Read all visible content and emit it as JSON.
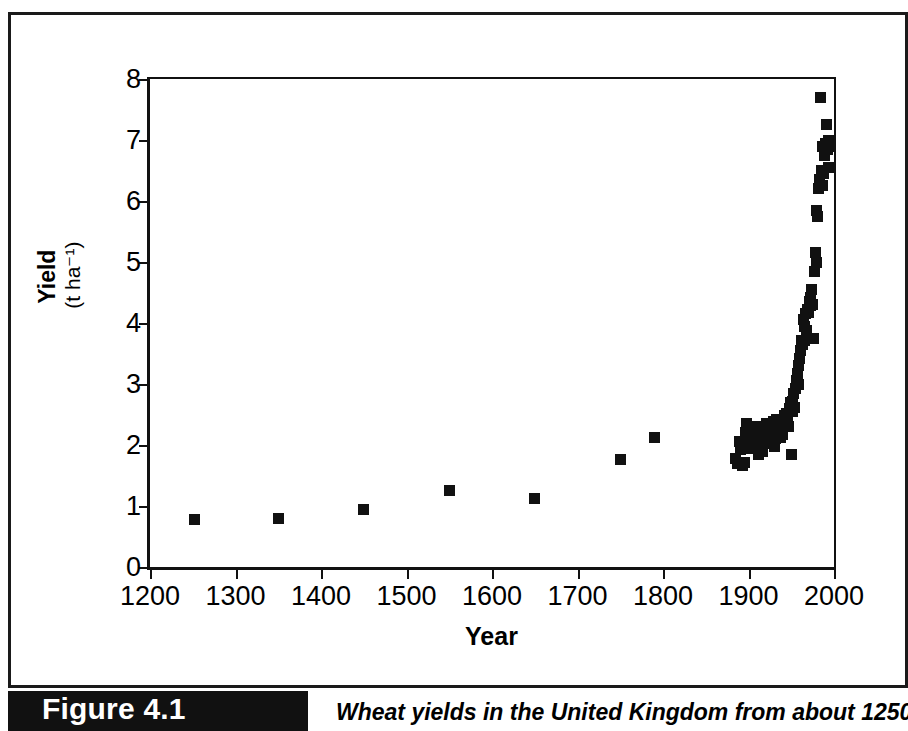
{
  "figure": {
    "tag_label": "Figure 4.1",
    "caption": "Wheat yields in the United Kingdom from about 1250 to"
  },
  "chart_data": {
    "type": "scatter",
    "title": "",
    "xlabel": "Year",
    "ylabel": "Yield",
    "ylabel_unit": "(t ha⁻¹)",
    "xlim": [
      1200,
      2000
    ],
    "ylim": [
      0,
      8
    ],
    "xticks": [
      1200,
      1300,
      1400,
      1500,
      1600,
      1700,
      1800,
      1900,
      2000
    ],
    "yticks": [
      0,
      1,
      2,
      3,
      4,
      5,
      6,
      7,
      8
    ],
    "grid": false,
    "legend": "none",
    "marker": "filled-square",
    "marker_color": "#111111",
    "points": [
      [
        1252,
        0.78
      ],
      [
        1350,
        0.79
      ],
      [
        1450,
        0.94
      ],
      [
        1550,
        1.26
      ],
      [
        1650,
        1.12
      ],
      [
        1750,
        1.76
      ],
      [
        1790,
        2.12
      ],
      [
        1885,
        1.78
      ],
      [
        1887,
        1.7
      ],
      [
        1889,
        2.05
      ],
      [
        1891,
        1.93
      ],
      [
        1893,
        1.66
      ],
      [
        1895,
        1.72
      ],
      [
        1896,
        2.2
      ],
      [
        1897,
        2.1
      ],
      [
        1898,
        2.35
      ],
      [
        1899,
        2.22
      ],
      [
        1900,
        2.12
      ],
      [
        1901,
        2.02
      ],
      [
        1902,
        2.3
      ],
      [
        1903,
        1.95
      ],
      [
        1904,
        2.18
      ],
      [
        1905,
        2.26
      ],
      [
        1906,
        2.3
      ],
      [
        1907,
        2.05
      ],
      [
        1908,
        2.18
      ],
      [
        1909,
        2.28
      ],
      [
        1910,
        2.1
      ],
      [
        1911,
        2.22
      ],
      [
        1912,
        1.85
      ],
      [
        1913,
        2.2
      ],
      [
        1914,
        2.28
      ],
      [
        1915,
        2.12
      ],
      [
        1916,
        1.9
      ],
      [
        1917,
        2.02
      ],
      [
        1918,
        2.3
      ],
      [
        1919,
        2.05
      ],
      [
        1920,
        2.18
      ],
      [
        1921,
        2.35
      ],
      [
        1922,
        2.12
      ],
      [
        1923,
        2.26
      ],
      [
        1924,
        2.2
      ],
      [
        1925,
        2.32
      ],
      [
        1926,
        2.15
      ],
      [
        1927,
        2.05
      ],
      [
        1928,
        2.28
      ],
      [
        1929,
        2.38
      ],
      [
        1930,
        1.98
      ],
      [
        1931,
        2.1
      ],
      [
        1932,
        2.3
      ],
      [
        1933,
        2.42
      ],
      [
        1934,
        2.35
      ],
      [
        1935,
        2.28
      ],
      [
        1936,
        2.2
      ],
      [
        1937,
        2.12
      ],
      [
        1938,
        2.4
      ],
      [
        1939,
        2.35
      ],
      [
        1940,
        2.18
      ],
      [
        1941,
        2.3
      ],
      [
        1942,
        2.48
      ],
      [
        1943,
        2.42
      ],
      [
        1944,
        2.38
      ],
      [
        1945,
        2.52
      ],
      [
        1946,
        2.45
      ],
      [
        1947,
        2.3
      ],
      [
        1948,
        2.6
      ],
      [
        1949,
        2.7
      ],
      [
        1950,
        1.85
      ],
      [
        1951,
        2.55
      ],
      [
        1952,
        2.72
      ],
      [
        1953,
        2.85
      ],
      [
        1954,
        2.62
      ],
      [
        1955,
        2.92
      ],
      [
        1956,
        3.05
      ],
      [
        1957,
        3.18
      ],
      [
        1958,
        3.0
      ],
      [
        1959,
        3.3
      ],
      [
        1960,
        3.42
      ],
      [
        1961,
        3.55
      ],
      [
        1962,
        3.72
      ],
      [
        1963,
        3.65
      ],
      [
        1964,
        4.05
      ],
      [
        1965,
        3.95
      ],
      [
        1966,
        3.72
      ],
      [
        1967,
        4.15
      ],
      [
        1968,
        3.88
      ],
      [
        1969,
        4.22
      ],
      [
        1970,
        4.18
      ],
      [
        1971,
        4.35
      ],
      [
        1972,
        4.42
      ],
      [
        1973,
        4.28
      ],
      [
        1974,
        4.55
      ],
      [
        1975,
        4.3
      ],
      [
        1976,
        3.75
      ],
      [
        1977,
        4.85
      ],
      [
        1978,
        5.15
      ],
      [
        1979,
        5.0
      ],
      [
        1980,
        5.85
      ],
      [
        1981,
        5.75
      ],
      [
        1982,
        6.2
      ],
      [
        1983,
        6.35
      ],
      [
        1984,
        7.7
      ],
      [
        1985,
        6.5
      ],
      [
        1986,
        6.9
      ],
      [
        1987,
        6.25
      ],
      [
        1988,
        6.45
      ],
      [
        1989,
        6.75
      ],
      [
        1990,
        6.95
      ],
      [
        1991,
        7.25
      ],
      [
        1992,
        6.85
      ],
      [
        1993,
        7.0
      ],
      [
        1994,
        6.55
      ],
      [
        1995,
        6.9
      ]
    ]
  }
}
